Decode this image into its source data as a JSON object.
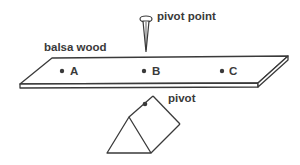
{
  "diagram": {
    "labels": {
      "board": "balsa wood",
      "pin": "pivot point",
      "prism": "pivot"
    },
    "points": [
      {
        "id": "A",
        "label": "A"
      },
      {
        "id": "B",
        "label": "B"
      },
      {
        "id": "C",
        "label": "C"
      }
    ],
    "colors": {
      "line": "#3a3a3a",
      "background": "#ffffff"
    }
  }
}
